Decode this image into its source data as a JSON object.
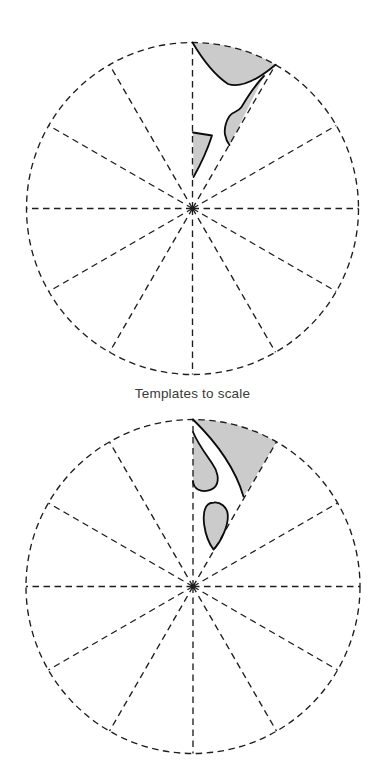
{
  "caption": {
    "text": "Templates to scale"
  },
  "diagram": {
    "colors": {
      "background": "#ffffff",
      "dash_line": "#1d1d1d",
      "template_fill": "#cbcbcb",
      "template_outline": "#0b0b0b",
      "caption_text": "#3a3a3a"
    },
    "wheels": [
      {
        "name": "upper-template-wheel",
        "cx": 192.5,
        "cy": 208.5,
        "r": 166,
        "sectors": 12,
        "templates": [
          {
            "name": "gore-template-1",
            "fill_path": "M192.5,42.5 A166,166 0 0 1 275.5,64.7 Q245.5,90 228,84 Q210,72 192.5,42.5 Z",
            "outline_path": "M275.5,64.7 Q245.5,90 228,84 Q210,72 192.5,42.5"
          },
          {
            "name": "gore-template-2",
            "fill_path": "M264,76 C255,85 248,96 241.5,107 C238,112.5 232.5,111.5 229.5,116 C226,121 224,129 225,134.5 C225.8,139 227,142 229.5,145 Z",
            "outline_path": "M264,76 C255,85 248,96 241.5,107 C238,112.5 232.5,111.5 229.5,116 C226,121 224,129 225,134.5 C225.8,139 227,142 229.5,145"
          },
          {
            "name": "gore-template-3",
            "fill_path": "M193,132.5 L212,135.5 Q205.5,156 193.5,177 Z",
            "outline_path": "M193,132.5 L212,135.5 Q205.5,156 193.5,177"
          }
        ]
      },
      {
        "name": "lower-template-wheel",
        "cx": 193,
        "cy": 586.5,
        "r": 167,
        "sectors": 12,
        "templates": [
          {
            "name": "gore-template-4",
            "fill_path": "M193,419.5 A167,167 0 0 1 276.5,441.9 L243.5,496.5 Q232,457.5 193,419.5 Z",
            "outline_path": "M243.5,496.5 Q232,457.5 193,419.5"
          },
          {
            "name": "gore-template-5",
            "fill_path": "M193,432 C198,444 206.5,455 212.5,464 C217.5,471 219.5,479.5 216,485.5 C212.5,491 203.5,492.5 198,489.5 C194.8,487.6 193.2,484.8 193,481 Z",
            "outline_path": "M193,432 C198,444 206.5,455 212.5,464 C217.5,471 219.5,479.5 216,485.5 C212.5,491 203.5,492.5 198,489.5 C194.8,487.6 193.2,484.8 193,481"
          },
          {
            "name": "gore-template-6",
            "fill_path": "M214,502.5 C220.5,502 226.5,506.5 227.6,513.5 C229.2,524 221.5,541.5 213.5,549.5 C209,543.5 205.5,534 204.2,525 C203,515.5 204.2,507.5 208.2,504.3 C210.2,502.8 212,502.6 214,502.5 Z",
            "outline_path": "M214,502.5 C220.5,502 226.5,506.5 227.6,513.5 C229.2,524 221.5,541.5 213.5,549.5 C209,543.5 205.5,534 204.2,525 C203,515.5 204.2,507.5 208.2,504.3 C210.2,502.8 212,502.6 214,502.5 Z"
          }
        ]
      }
    ]
  }
}
